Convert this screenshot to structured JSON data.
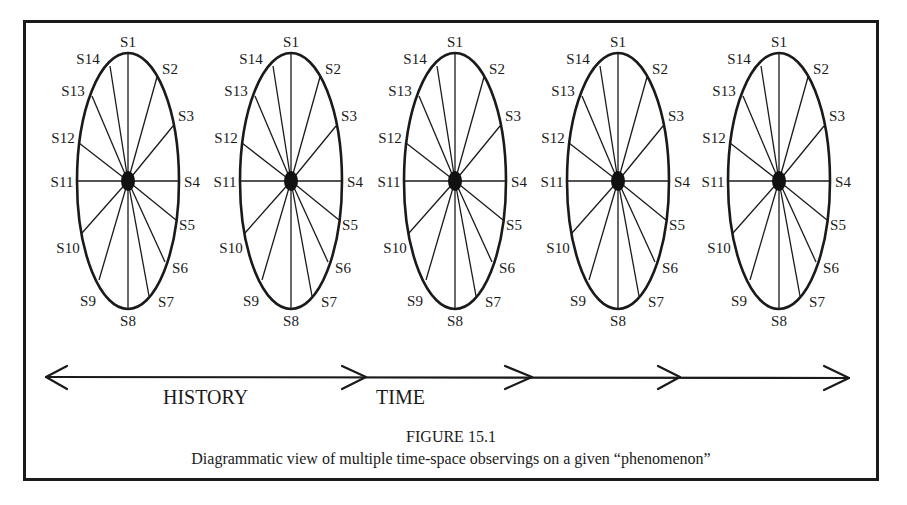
{
  "figure": {
    "number_label": "FIGURE 15.1",
    "caption": "Diagrammatic view of multiple time-space observings on a given “phenomenon”"
  },
  "observers": {
    "count": 5,
    "labels": [
      "S1",
      "S2",
      "S3",
      "S4",
      "S5",
      "S6",
      "S7",
      "S8",
      "S9",
      "S10",
      "S11",
      "S12",
      "S13",
      "S14"
    ],
    "centers_x": [
      128,
      291,
      455,
      618,
      779
    ],
    "center_y": 181
  },
  "timeline": {
    "history_label": "HISTORY",
    "time_label": "TIME",
    "arrowheads": [
      "left",
      "right",
      "right",
      "right",
      "right"
    ]
  },
  "colors": {
    "ink": "#1a1a1a",
    "background": "#ffffff"
  }
}
